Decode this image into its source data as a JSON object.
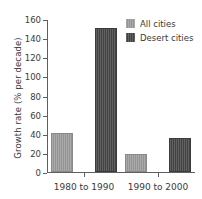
{
  "chart_data": {
    "type": "bar",
    "title": "",
    "xlabel": "",
    "ylabel": "Growth rate (% per decade)",
    "categories": [
      "1980 to 1990",
      "1990 to 2000"
    ],
    "series": [
      {
        "name": "All cities",
        "color": "#9a9a9a",
        "values": [
          41,
          19
        ]
      },
      {
        "name": "Desert cities",
        "color": "#4a4a4a",
        "values": [
          151,
          36
        ]
      }
    ],
    "ylim": [
      0,
      160
    ],
    "yticks": [
      0,
      20,
      40,
      60,
      80,
      100,
      120,
      140,
      160
    ],
    "ytick_labels": [
      "0",
      "20",
      "40",
      "60",
      "80",
      "100",
      "120",
      "140",
      "160"
    ],
    "grid": false,
    "legend_position": "top-right",
    "background_color": "#ffffff",
    "axis_color": "#5f5f5f"
  }
}
